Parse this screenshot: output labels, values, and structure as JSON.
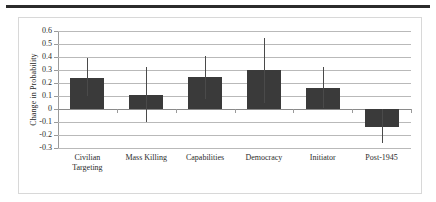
{
  "chart_data": {
    "type": "bar",
    "title": "",
    "xlabel": "",
    "ylabel": "Change in Probability",
    "categories": [
      "Civilian Targeting",
      "Mass Killing",
      "Capabilities",
      "Democracy",
      "Initiator",
      "Post-1945"
    ],
    "category_lines": [
      [
        "Civilian",
        "Targeting"
      ],
      [
        "Mass Killing"
      ],
      [
        "Capabilities"
      ],
      [
        "Democracy"
      ],
      [
        "Initiator"
      ],
      [
        "Post-1945"
      ]
    ],
    "values": [
      0.24,
      0.11,
      0.25,
      0.3,
      0.16,
      -0.14
    ],
    "error_high": [
      0.39,
      0.32,
      0.41,
      0.55,
      0.32,
      0.0
    ],
    "error_low": [
      0.1,
      -0.1,
      0.08,
      0.05,
      0.01,
      -0.26
    ],
    "ylim": [
      -0.3,
      0.6
    ],
    "ytick_values": [
      0.6,
      0.5,
      0.4,
      0.3,
      0.2,
      0.1,
      0,
      -0.1,
      -0.2,
      -0.3
    ],
    "ytick_labels": [
      "0.6",
      "0.5",
      "0.4",
      "0.3",
      "0.2",
      "0.1",
      "0",
      "-0.1",
      "-0.2",
      "-0.3"
    ],
    "grid": true,
    "legend": "none",
    "bar_color": "#3a3a3a",
    "gridline_color": "#b9b9b9",
    "zeroline_color": "#8a8a8a",
    "whisker_color": "#4a4a4a"
  }
}
